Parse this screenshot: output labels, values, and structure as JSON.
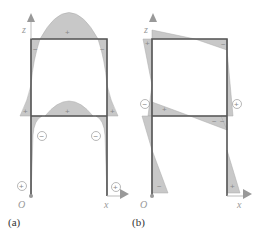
{
  "diagram": {
    "type": "frame bending moment diagrams",
    "panels": [
      {
        "caption": "(a)",
        "axes": {
          "vertical": "z",
          "horizontal": "x",
          "origin": "O"
        },
        "signs": {
          "top_beam": "+",
          "mid_beam": "+",
          "top_left_corner": "−",
          "top_right_corner": "−",
          "mid_left_outer": "+",
          "mid_right_outer": "+",
          "lower_left_circle": "−",
          "lower_right_circle": "−",
          "base_left_circle": "+",
          "base_right_circle": "+"
        }
      },
      {
        "caption": "(b)",
        "axes": {
          "vertical": "z",
          "horizontal": "x",
          "origin": "O"
        },
        "signs": {
          "top_left": "+",
          "top_right": "−",
          "left_circle": "−",
          "right_circle": "+",
          "mid_left": "+",
          "mid_beam_right": "−",
          "mid_right": "−",
          "base_left": "−",
          "base_right": "+"
        }
      }
    ],
    "colors": {
      "fill": "#c8c8c8",
      "frame": "#555555",
      "axis": "#999999"
    }
  }
}
